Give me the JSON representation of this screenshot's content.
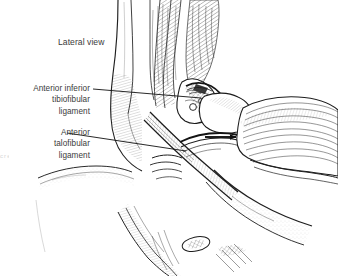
{
  "figure": {
    "width": 338,
    "height": 276,
    "background_color": "#ffffff",
    "ink_color": "#1a1a1a",
    "text_color": "#3b3b3b",
    "style": "pen-and-ink line drawing with hatching"
  },
  "view_title": {
    "text": "Lateral view"
  },
  "labels": [
    {
      "id": "anterior-inferior-tibiofibular-ligament",
      "lines": [
        "Anterior inferior",
        "tibiofibular",
        "ligament"
      ],
      "leader": {
        "x1": 93,
        "y1": 89,
        "x2": 201,
        "y2": 98
      }
    },
    {
      "id": "anterior-talofibular-ligament",
      "lines": [
        "Anterior",
        "talofibular",
        "ligament"
      ],
      "leader": {
        "x1": 67,
        "y1": 133,
        "x2": 186,
        "y2": 151
      }
    }
  ],
  "pointer_arrow": {
    "name": "direction-arrow",
    "x1": 205,
    "y1": 137,
    "x2": 241,
    "y2": 137,
    "color": "#111111"
  },
  "edge_caption": {
    "text": "c r e d i t",
    "legible": false
  }
}
